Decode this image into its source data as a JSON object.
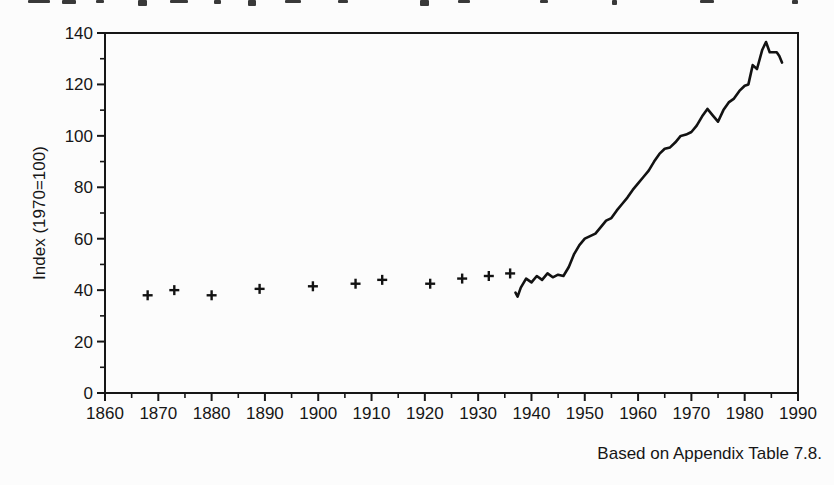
{
  "page": {
    "background": "#fcfcfc",
    "ink": "#161616"
  },
  "top_cropped_text": {
    "description": "bottom fragments of a cut-off text line at the top edge (illegible)",
    "marks": [
      {
        "x": 28,
        "w": 22,
        "h": 3
      },
      {
        "x": 62,
        "w": 14,
        "h": 4
      },
      {
        "x": 96,
        "w": 8,
        "h": 3
      },
      {
        "x": 138,
        "w": 9,
        "h": 6
      },
      {
        "x": 170,
        "w": 18,
        "h": 3
      },
      {
        "x": 214,
        "w": 7,
        "h": 4
      },
      {
        "x": 248,
        "w": 8,
        "h": 6
      },
      {
        "x": 285,
        "w": 16,
        "h": 3
      },
      {
        "x": 338,
        "w": 10,
        "h": 3
      },
      {
        "x": 420,
        "w": 9,
        "h": 6
      },
      {
        "x": 458,
        "w": 12,
        "h": 3
      },
      {
        "x": 540,
        "w": 8,
        "h": 3
      },
      {
        "x": 612,
        "w": 5,
        "h": 5
      },
      {
        "x": 700,
        "w": 14,
        "h": 3
      },
      {
        "x": 792,
        "w": 6,
        "h": 4
      }
    ]
  },
  "caption": {
    "text": "Based on Appendix Table 7.8."
  },
  "chart_data": {
    "type": "line",
    "title": "",
    "xlabel": "",
    "ylabel": "Index (1970=100)",
    "xlim": [
      1860,
      1990
    ],
    "ylim": [
      0,
      140
    ],
    "x_major_ticks": [
      1860,
      1870,
      1880,
      1890,
      1900,
      1910,
      1920,
      1930,
      1940,
      1950,
      1960,
      1970,
      1980,
      1990
    ],
    "x_minor_ticks": [
      1865,
      1875,
      1885,
      1895,
      1905,
      1915,
      1925,
      1935,
      1945,
      1955,
      1965,
      1975,
      1985
    ],
    "y_major_ticks": [
      0,
      20,
      40,
      60,
      80,
      100,
      120,
      140
    ],
    "y_minor_ticks": [
      10,
      30,
      50,
      70,
      90,
      110,
      130
    ],
    "grid": false,
    "legend": false,
    "series": [
      {
        "name": "benchmark years",
        "type": "scatter",
        "marker": "plus",
        "points": [
          [
            1868,
            38
          ],
          [
            1873,
            40
          ],
          [
            1880,
            38
          ],
          [
            1889,
            40.5
          ],
          [
            1899,
            41.5
          ],
          [
            1907,
            42.5
          ],
          [
            1912,
            44
          ],
          [
            1921,
            42.5
          ],
          [
            1927,
            44.5
          ],
          [
            1932,
            45.5
          ],
          [
            1936,
            46.5
          ]
        ]
      },
      {
        "name": "annual index",
        "type": "line",
        "points": [
          [
            1937,
            39
          ],
          [
            1937.4,
            37.5
          ],
          [
            1938,
            41
          ],
          [
            1939,
            44.5
          ],
          [
            1940,
            43
          ],
          [
            1941,
            45.5
          ],
          [
            1942,
            44
          ],
          [
            1943,
            46.5
          ],
          [
            1944,
            45
          ],
          [
            1945,
            46
          ],
          [
            1946,
            45.5
          ],
          [
            1947,
            49
          ],
          [
            1948,
            54
          ],
          [
            1949,
            57.5
          ],
          [
            1950,
            60
          ],
          [
            1951,
            61
          ],
          [
            1952,
            62
          ],
          [
            1953,
            64.5
          ],
          [
            1954,
            67
          ],
          [
            1955,
            68
          ],
          [
            1956,
            71
          ],
          [
            1957,
            73.5
          ],
          [
            1958,
            76
          ],
          [
            1959,
            79
          ],
          [
            1960,
            81.5
          ],
          [
            1961,
            84
          ],
          [
            1962,
            86.5
          ],
          [
            1963,
            90
          ],
          [
            1964,
            93
          ],
          [
            1965,
            95
          ],
          [
            1966,
            95.5
          ],
          [
            1967,
            97.5
          ],
          [
            1968,
            100
          ],
          [
            1969,
            100.5
          ],
          [
            1970,
            101.5
          ],
          [
            1971,
            104
          ],
          [
            1972,
            107.5
          ],
          [
            1973,
            110.5
          ],
          [
            1974,
            108
          ],
          [
            1975,
            105.5
          ],
          [
            1976,
            110
          ],
          [
            1977,
            113
          ],
          [
            1978,
            114.5
          ],
          [
            1979,
            117.5
          ],
          [
            1980,
            119.5
          ],
          [
            1980.7,
            120
          ],
          [
            1981.5,
            127.5
          ],
          [
            1982.3,
            126
          ],
          [
            1983.3,
            133.5
          ],
          [
            1984,
            136.5
          ],
          [
            1984.7,
            132.5
          ],
          [
            1986,
            132.5
          ],
          [
            1986.5,
            131
          ],
          [
            1987,
            128.5
          ]
        ]
      }
    ]
  }
}
